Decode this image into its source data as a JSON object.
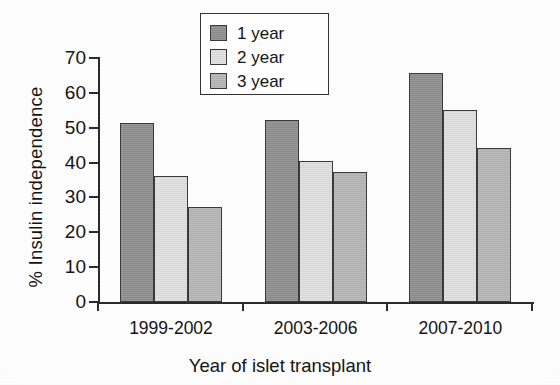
{
  "chart_data": {
    "type": "bar",
    "title": "",
    "xlabel": "Year of islet transplant",
    "ylabel": "% Insulin independence",
    "categories": [
      "1999-2002",
      "2003-2006",
      "2007-2010"
    ],
    "series": [
      {
        "name": "1 year",
        "color": "#8e8e8e",
        "values": [
          51.5,
          52.2,
          65.7
        ]
      },
      {
        "name": "2 year",
        "color": "#e0e0e0",
        "values": [
          36.1,
          40.4,
          55.2
        ]
      },
      {
        "name": "3 year",
        "color": "#b6b6b6",
        "values": [
          27.2,
          37.3,
          44.2
        ]
      }
    ],
    "ylim": [
      0,
      70
    ],
    "ytick_values": [
      0,
      10,
      20,
      30,
      40,
      50,
      60,
      70
    ],
    "ytick_labels": [
      "0",
      "10",
      "20",
      "30",
      "40",
      "50",
      "60",
      "70"
    ],
    "grid": false,
    "legend_position": "top-center"
  },
  "legend": {
    "items": [
      {
        "label": "1 year"
      },
      {
        "label": "2 year"
      },
      {
        "label": "3 year"
      }
    ]
  },
  "axes": {
    "y_title": "% Insulin independence",
    "x_title": "Year of islet transplant"
  }
}
